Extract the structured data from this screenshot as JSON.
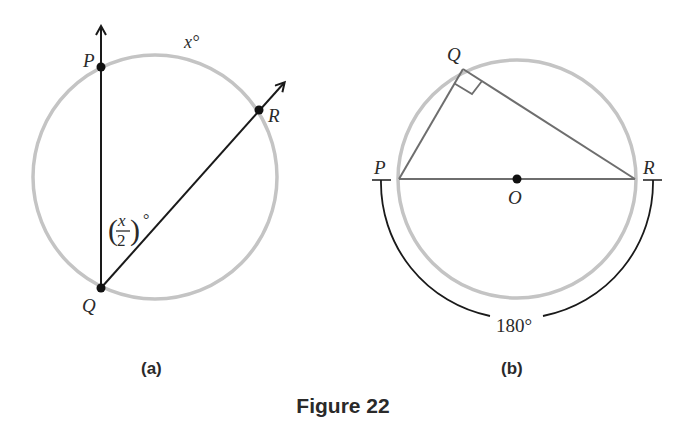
{
  "figure": {
    "title": "Figure 22",
    "colors": {
      "circle": "#c4c4c4",
      "line": "#1a1a1a",
      "triangle": "#6e6e6e",
      "text": "#2a2a2a"
    }
  },
  "panel_a": {
    "caption": "(a)",
    "points": {
      "P": {
        "label": "P",
        "x": 101,
        "y": 67
      },
      "Q": {
        "label": "Q",
        "x": 101,
        "y": 288
      },
      "R": {
        "label": "R",
        "x": 259,
        "y": 110
      }
    },
    "arc_label": "x°",
    "angle_label": {
      "numerator": "x",
      "denominator": "2",
      "open_paren": "(",
      "close_paren": ")",
      "degree": "°"
    }
  },
  "panel_b": {
    "caption": "(b)",
    "points": {
      "P": {
        "label": "P",
        "x": 399,
        "y": 179
      },
      "Q": {
        "label": "Q",
        "x": 463,
        "y": 69
      },
      "R": {
        "label": "R",
        "x": 635,
        "y": 179
      },
      "O": {
        "label": "O",
        "x": 517,
        "y": 179
      }
    },
    "arc_label": "180°"
  }
}
